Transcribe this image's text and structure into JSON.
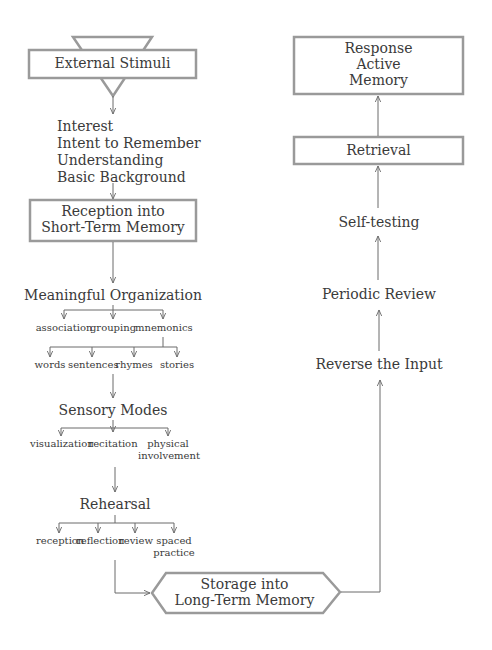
{
  "diagram": {
    "left_column": {
      "external_stimuli": "External Stimuli",
      "prerequisites": [
        "Interest",
        "Intent to Remember",
        "Understanding",
        "Basic Background"
      ],
      "reception": [
        "Reception into",
        "Short-Term Memory"
      ],
      "meaningful_organization": {
        "label": "Meaningful Organization",
        "children": [
          "association",
          "grouping",
          "mnemonics"
        ],
        "mnemonics_children": [
          "words",
          "sentences",
          "rhymes",
          "stories"
        ]
      },
      "sensory_modes": {
        "label": "Sensory Modes",
        "children": [
          "visualization",
          "recitation",
          "physical",
          "involvement"
        ]
      },
      "rehearsal": {
        "label": "Rehearsal",
        "children": [
          "reception",
          "reflection",
          "review",
          "spaced",
          "practice"
        ]
      }
    },
    "storage": [
      "Storage into",
      "Long-Term Memory"
    ],
    "right_column": {
      "reverse_input": "Reverse the Input",
      "periodic_review": "Periodic Review",
      "self_testing": "Self-testing",
      "retrieval": "Retrieval",
      "response": [
        "Response",
        "Active",
        "Memory"
      ]
    },
    "colors": {
      "box_border": "#9a9a9a",
      "line": "#6a6a6a",
      "text": "#3a3a3a"
    }
  }
}
